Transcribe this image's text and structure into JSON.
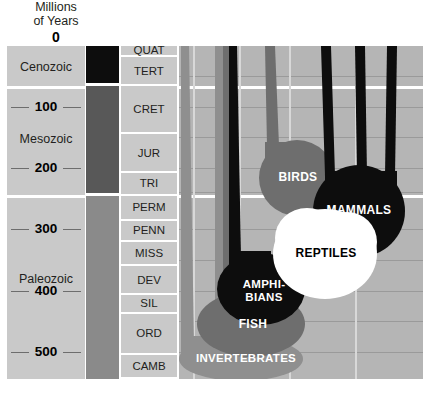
{
  "header": {
    "line1": "Millions",
    "line2": "of Years",
    "zero": "0"
  },
  "colors": {
    "plot_background": "#b5b5b5",
    "panel_background": "#c9c9c9",
    "cenozoic_swatch": "#0d0d0d",
    "mesozoic_swatch": "#585858",
    "paleozoic_swatch": "#8a8a8a",
    "gridline": "#9a9a9a",
    "era_divider": "#ffffff",
    "dark_clade": "#0d0d0d",
    "mid_clade": "#6e6e6e",
    "light_clade": "#8f8f8f",
    "white_clade": "#ffffff"
  },
  "axis": {
    "label": "Millions of Years",
    "ticks": [
      "0",
      "100",
      "200",
      "300",
      "400",
      "500"
    ],
    "range_start": 0,
    "range_end": 545
  },
  "eras": [
    {
      "name": "Cenozoic",
      "start_mya": 0,
      "end_mya": 66,
      "swatch": "#0d0d0d"
    },
    {
      "name": "Mesozoic",
      "start_mya": 66,
      "end_mya": 245,
      "swatch": "#585858"
    },
    {
      "name": "Paleozoic",
      "start_mya": 245,
      "end_mya": 545,
      "swatch": "#8a8a8a"
    }
  ],
  "periods": [
    {
      "abbr": "QUAT",
      "start_mya": 0,
      "end_mya": 18
    },
    {
      "abbr": "TERT",
      "start_mya": 18,
      "end_mya": 66
    },
    {
      "abbr": "CRET",
      "start_mya": 66,
      "end_mya": 144
    },
    {
      "abbr": "JUR",
      "start_mya": 144,
      "end_mya": 208
    },
    {
      "abbr": "TRI",
      "start_mya": 208,
      "end_mya": 245
    },
    {
      "abbr": "PERM",
      "start_mya": 245,
      "end_mya": 286
    },
    {
      "abbr": "PENN",
      "start_mya": 286,
      "end_mya": 320
    },
    {
      "abbr": "MISS",
      "start_mya": 320,
      "end_mya": 360
    },
    {
      "abbr": "DEV",
      "start_mya": 360,
      "end_mya": 408
    },
    {
      "abbr": "SIL",
      "start_mya": 408,
      "end_mya": 438
    },
    {
      "abbr": "ORD",
      "start_mya": 438,
      "end_mya": 505
    },
    {
      "abbr": "CAMB",
      "start_mya": 505,
      "end_mya": 545
    }
  ],
  "chart_data": {
    "type": "area",
    "xlabel": "",
    "ylabel": "Millions of Years",
    "ylim": [
      0,
      545
    ],
    "y_inverted": true,
    "grid": true,
    "legend": "none",
    "categories": [
      "INVERTEBRATES",
      "FISH",
      "AMPHIBIANS",
      "REPTILES",
      "BIRDS",
      "MAMMALS"
    ],
    "series": [
      {
        "name": "INVERTEBRATES",
        "color": "#8f8f8f",
        "origin_mya": 545,
        "peak_mya": 520,
        "label": "INVERTEBRATES",
        "label_color": "#ffffff"
      },
      {
        "name": "FISH",
        "color": "#6e6e6e",
        "origin_mya": 505,
        "peak_mya": 430,
        "label": "FISH",
        "label_color": "#ffffff"
      },
      {
        "name": "AMPHIBIANS",
        "color": "#0d0d0d",
        "origin_mya": 440,
        "peak_mya": 350,
        "label": "AMPHI-\nBIANS",
        "label_color": "#ffffff"
      },
      {
        "name": "REPTILES",
        "color": "#ffffff",
        "origin_mya": 360,
        "peak_mya": 255,
        "label": "REPTILES",
        "label_color": "#000000"
      },
      {
        "name": "BIRDS",
        "color": "#6e6e6e",
        "origin_mya": 250,
        "peak_mya": 175,
        "label": "BIRDS",
        "label_color": "#ffffff"
      },
      {
        "name": "MAMMALS",
        "color": "#0d0d0d",
        "origin_mya": 250,
        "peak_mya": 165,
        "label": "MAMMALS",
        "label_color": "#ffffff"
      }
    ]
  }
}
